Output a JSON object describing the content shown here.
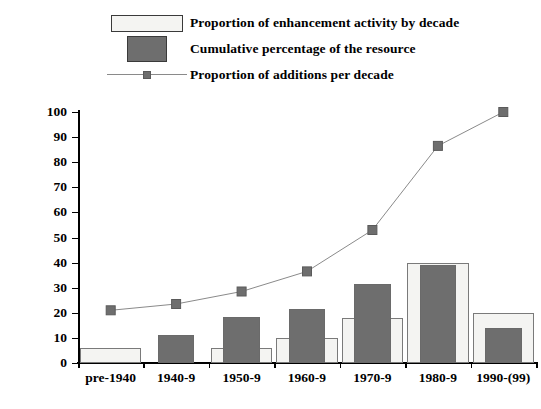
{
  "chart_data": {
    "type": "bar",
    "title": "",
    "xlabel": "",
    "ylabel": "% of records",
    "ylim": [
      0,
      100
    ],
    "ytick_step": 10,
    "grid": false,
    "legend_position": "top-left",
    "categories": [
      "pre-1940",
      "1940-9",
      "1950-9",
      "1960-9",
      "1970-9",
      "1980-9",
      "1990-(99)"
    ],
    "series": [
      {
        "name": "Proportion of enhancement activity by decade",
        "type": "bar",
        "style": "open",
        "color": "#f4f4f2",
        "border_color": "#7a7a7a",
        "values": [
          6,
          0,
          6,
          10,
          18,
          40,
          20
        ]
      },
      {
        "name": "Cumulative percentage of the resource",
        "type": "bar",
        "style": "filled",
        "color": "#6e6e6e",
        "border_color": "#6a6a6a",
        "values": [
          0,
          11,
          18.5,
          21.5,
          31.5,
          39,
          14
        ]
      },
      {
        "name": "Proportion of additions per decade",
        "type": "line",
        "color": "#8a8a8a",
        "marker_color": "#6e6e6e",
        "values": [
          21,
          23.5,
          28.5,
          36.5,
          53,
          86.5,
          100
        ]
      }
    ],
    "ytick_labels": [
      "100",
      "90",
      "80",
      "70",
      "60",
      "50",
      "40",
      "30",
      "20",
      "10",
      "0"
    ]
  },
  "legend": {
    "items": [
      {
        "label": "Proportion of enhancement activity by decade",
        "swatch": "open-rect-swatch"
      },
      {
        "label": "Cumulative percentage of the resource",
        "swatch": "filled-rect-swatch"
      },
      {
        "label": "Proportion of additions per decade",
        "swatch": "line-marker-swatch"
      }
    ]
  },
  "axis": {
    "y_title": "% of records"
  }
}
